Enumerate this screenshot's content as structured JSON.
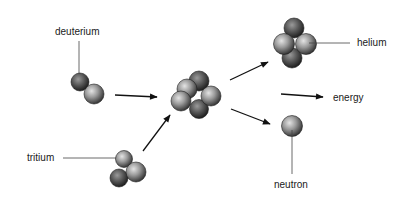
{
  "diagram": {
    "type": "nuclear-fusion-reaction",
    "labels": {
      "deuterium": "deuterium",
      "tritium": "tritium",
      "helium": "helium",
      "energy": "energy",
      "neutron": "neutron"
    },
    "nodes": [
      {
        "id": "deuterium",
        "particles": 2
      },
      {
        "id": "tritium",
        "particles": 3
      },
      {
        "id": "intermediate",
        "particles": 5
      },
      {
        "id": "helium",
        "particles": 4
      },
      {
        "id": "neutron",
        "particles": 1
      },
      {
        "id": "energy",
        "particles": 0
      }
    ],
    "edges": [
      {
        "from": "deuterium",
        "to": "intermediate"
      },
      {
        "from": "tritium",
        "to": "intermediate"
      },
      {
        "from": "intermediate",
        "to": "helium"
      },
      {
        "from": "intermediate",
        "to": "energy"
      },
      {
        "from": "intermediate",
        "to": "neutron"
      }
    ],
    "colors": {
      "background": "#ffffff",
      "particle_light": "#d6d6d6",
      "particle_dark": "#3a3a3a",
      "line": "#111111"
    }
  }
}
